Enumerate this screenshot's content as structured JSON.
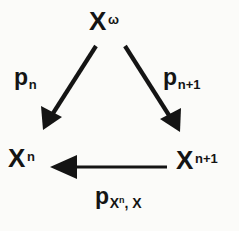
{
  "figure": {
    "type": "commutative-triangle-diagram",
    "background_color": "#fbfbf9",
    "ink_color": "#141414",
    "width": 239,
    "height": 231
  },
  "nodes": {
    "top": {
      "id": "node-top",
      "base": "X",
      "superscript": "ω",
      "full_text": "Xω",
      "x": 106,
      "y": 25
    },
    "bottom_left": {
      "id": "node-bottom-left",
      "base": "X",
      "superscript": "n",
      "full_text": "Xn",
      "x": 22,
      "y": 163
    },
    "bottom_right": {
      "id": "node-bottom-right",
      "base": "X",
      "superscript": "n+1",
      "full_text": "Xn+1",
      "x": 188,
      "y": 164
    }
  },
  "edges": {
    "top_to_left": {
      "id": "arrow-top-to-bottom-left",
      "from": "top",
      "to": "bottom_left",
      "direction": "down-left",
      "label_base": "p",
      "label_subscript": "n",
      "label_full": "pn",
      "x1": 96,
      "y1": 46,
      "x2": 44,
      "y2": 129
    },
    "top_to_right": {
      "id": "arrow-top-to-bottom-right",
      "from": "top",
      "to": "bottom_right",
      "direction": "down-right",
      "label_base": "p",
      "label_subscript": "n+1",
      "label_full": "pn+1",
      "x1": 125,
      "y1": 46,
      "x2": 179,
      "y2": 131
    },
    "right_to_left": {
      "id": "arrow-bottom-right-to-bottom-left",
      "from": "bottom_right",
      "to": "bottom_left",
      "direction": "left",
      "label_base": "p",
      "label_subscript_base": "X",
      "label_subscript_sup": "n",
      "label_subscript_tail": ", X",
      "label_full": "pXn, X",
      "x1": 167,
      "y1": 167,
      "x2": 51,
      "y2": 167
    }
  }
}
